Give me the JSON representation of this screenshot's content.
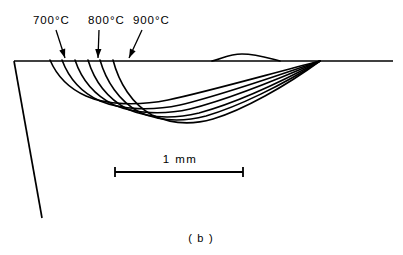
{
  "figure": {
    "caption": "( b )",
    "background_color": "#ffffff",
    "line_color": "#000000"
  },
  "isotherm_labels": [
    {
      "id": "iso-700",
      "text": "700°C",
      "x": 33,
      "y": 24
    },
    {
      "id": "iso-800",
      "text": "800°C",
      "x": 88,
      "y": 24
    },
    {
      "id": "iso-900",
      "text": "900°C",
      "x": 133,
      "y": 24
    }
  ],
  "scale_bar": {
    "label": "1 mm",
    "label_x": 180,
    "label_y": 163,
    "left_x": 115,
    "right_x": 243,
    "y": 172,
    "tick_half_height": 5
  },
  "chart_data": {
    "type": "line",
    "title": "",
    "subtitle": "",
    "xlabel": "",
    "ylabel": "",
    "grid": false,
    "legend_position": "none",
    "annotations": [
      {
        "text": "700°C",
        "points_to_x": 64,
        "points_to_y": 59
      },
      {
        "text": "800°C",
        "points_to_x": 98,
        "points_to_y": 59
      },
      {
        "text": "900°C",
        "points_to_x": 128,
        "points_to_y": 59
      }
    ],
    "scale_reference": {
      "length_label": "1 mm",
      "pixel_length": 128
    },
    "surface_line": {
      "x_start": 14,
      "x_end": 393,
      "y": 61
    },
    "left_boundary": {
      "x_start": 14,
      "y_start": 61,
      "x_end": 42,
      "y_end": 218
    },
    "series": [
      {
        "name": "contour-1",
        "path": "M 50 60 C 56 74, 68 88, 86 96 C 106 105, 138 106, 168 100 C 206 92, 262 76, 320 61"
      },
      {
        "name": "contour-2",
        "path": "M 62 60 C 68 76, 80 92, 100 101 C 122 110, 152 111, 180 105 C 218 96, 268 79, 320 61"
      },
      {
        "name": "contour-3",
        "path": "M 75 60 C 81 78, 94 95, 114 105 C 136 114, 164 115, 190 109 C 226 100, 274 81, 320 61"
      },
      {
        "name": "contour-4",
        "path": "M 88 60 C 94 80, 107 98, 127 109 C 148 118, 174 119, 199 113 C 232 104, 279 83, 320 61"
      },
      {
        "name": "contour-5",
        "path": "M 100 60 C 106 81, 119 101, 139 112 C 159 121, 183 122, 206 116 C 237 107, 283 85, 320 61"
      },
      {
        "name": "contour-6",
        "path": "M 113 60 C 119 83, 132 104, 152 115 C 171 124, 192 125, 213 119 C 243 110, 286 86, 320 61"
      }
    ],
    "surface_ridge": {
      "description": "small raised bead on surface",
      "path": "M 212 61 C 222 59, 228 54, 242 54 C 256 54, 268 58, 280 61"
    }
  },
  "leaders": [
    {
      "id": "leader-700",
      "x1": 56,
      "y1": 30,
      "x2": 65,
      "y2": 58
    },
    {
      "id": "leader-800",
      "x1": 99,
      "y1": 30,
      "x2": 98,
      "y2": 58
    },
    {
      "id": "leader-900",
      "x1": 142,
      "y1": 30,
      "x2": 129,
      "y2": 58
    }
  ]
}
